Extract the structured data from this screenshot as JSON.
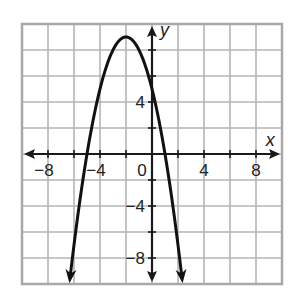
{
  "chart_data": {
    "type": "line",
    "title": "",
    "xlabel": "x",
    "ylabel": "y",
    "xlim": [
      -10,
      10
    ],
    "ylim": [
      -10,
      10
    ],
    "grid": true,
    "grid_step": 2,
    "x_tick_labels": [
      "-8",
      "-4",
      "0",
      "4",
      "8"
    ],
    "y_tick_labels": [
      "4",
      "-4",
      "-8"
    ],
    "x_ticks": [
      -8,
      -4,
      4,
      8
    ],
    "y_ticks": [
      4,
      -4,
      -8
    ],
    "origin_label": "0",
    "series": [
      {
        "name": "parabola",
        "equation": "y = -(x + 2)^2 + 9",
        "vertex": [
          -2,
          9
        ],
        "y_intercept": 5,
        "x_intercepts": [
          -5,
          1
        ],
        "x_range": [
          -6.3,
          2.3
        ],
        "points": [
          [
            -6.3,
            -9.49
          ],
          [
            -5,
            0
          ],
          [
            -4,
            5
          ],
          [
            -3,
            8
          ],
          [
            -2,
            9
          ],
          [
            -1,
            8
          ],
          [
            0,
            5
          ],
          [
            1,
            0
          ],
          [
            2,
            -7
          ],
          [
            2.3,
            -9.49
          ]
        ]
      }
    ]
  },
  "colors": {
    "grid": "#b5b5b5",
    "axis": "#1a1a1a",
    "curve": "#111111",
    "border": "#a8a8a8"
  }
}
